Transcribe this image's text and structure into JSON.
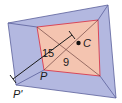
{
  "diagram": {
    "type": "dilation",
    "center_label": "C",
    "point_label": "P",
    "image_point_label": "P'",
    "distance_CP": "9",
    "distance_CP_prime": "15",
    "colors": {
      "outer_fill": "#b3b8e0",
      "outer_stroke": "#5a5f9a",
      "inner_fill": "#f4c4b0",
      "inner_stroke": "#d9485a",
      "line": "#2a2a2a"
    }
  }
}
